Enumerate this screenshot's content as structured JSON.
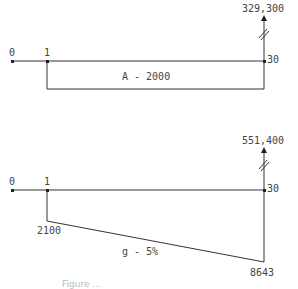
{
  "diagrams": [
    {
      "name": "uniform-series",
      "periods": {
        "start": "0",
        "first": "1",
        "end": "30"
      },
      "future_value": "329,300",
      "series_label": "A - 2000"
    },
    {
      "name": "geometric-gradient",
      "periods": {
        "start": "0",
        "first": "1",
        "end": "30"
      },
      "future_value": "551,400",
      "first_payment": "2100",
      "last_payment": "8643",
      "series_label": "g - 5%"
    }
  ],
  "caption": "Figure ..."
}
